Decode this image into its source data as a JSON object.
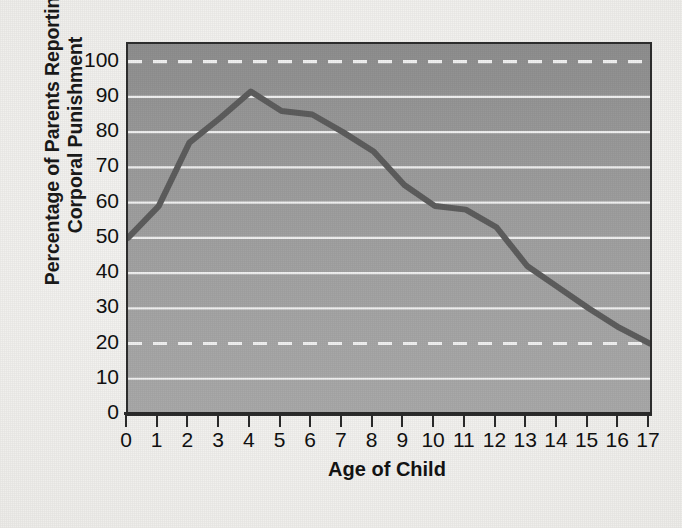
{
  "chart_data": {
    "type": "line",
    "title": "",
    "xlabel": "Age of Child",
    "ylabel_lines": [
      "Percentage of Parents Reporting",
      "Corporal Punishment"
    ],
    "ylabel": "Percentage of Parents Reporting Corporal Punishment",
    "x": [
      0,
      1,
      2,
      3,
      4,
      5,
      6,
      7,
      8,
      9,
      10,
      11,
      12,
      13,
      14,
      15,
      16,
      17
    ],
    "values": [
      50,
      59,
      77,
      84,
      91.5,
      86,
      85,
      80,
      74.5,
      65,
      59,
      58,
      53,
      42,
      36,
      30,
      24.5,
      20
    ],
    "x_tick_labels": [
      "0",
      "1",
      "2",
      "3",
      "4",
      "5",
      "6",
      "7",
      "8",
      "9",
      "10",
      "11",
      "12",
      "13",
      "14",
      "15",
      "16",
      "17"
    ],
    "y_tick_labels": [
      "0",
      "10",
      "20",
      "30",
      "40",
      "50",
      "60",
      "70",
      "80",
      "90",
      "100"
    ],
    "y_ticks": [
      0,
      10,
      20,
      30,
      40,
      50,
      60,
      70,
      80,
      90,
      100
    ],
    "xlim": [
      0,
      17
    ],
    "ylim": [
      0,
      105
    ],
    "grid": "horizontal",
    "solid_gridlines": [
      10,
      30,
      40,
      50,
      60,
      70,
      80,
      90
    ],
    "dashed_gridlines": [
      20,
      100
    ],
    "legend": "none",
    "series_name": "Percentage of parents reporting corporal punishment",
    "line_color": "#5d5d5d",
    "gridline_color": "#f0f0f0",
    "plot_background": "#9d9d9d",
    "page_background": "#f1f0ed",
    "axis_color": "#2b2b2b",
    "text_color": "#111111"
  }
}
